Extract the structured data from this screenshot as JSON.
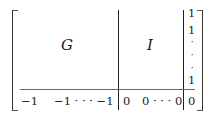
{
  "matrix": {
    "blocks": {
      "top_left": "G",
      "top_middle": "I"
    },
    "right_column": {
      "top_entries": [
        "1",
        "1"
      ],
      "vdots": [
        "·",
        "·",
        "·"
      ],
      "last_entry": "1",
      "bottom_entry": "0"
    },
    "bottom_row": {
      "left_first": "−1",
      "left_rest": "−1 · · · −1",
      "middle_first": "0",
      "middle_rest": "0 · · · 0"
    }
  }
}
